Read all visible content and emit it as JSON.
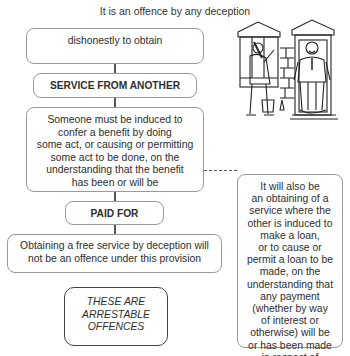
{
  "title": "It is an offence by any deception",
  "flow": {
    "box1": "dishonestly to obtain",
    "box2": "SERVICE FROM ANOTHER",
    "box3": "Someone must be induced to\nconfer a benefit by doing\nsome act, or causing or permitting\nsome act to be done, on the\nunderstanding that the benefit\nhas been or will be",
    "box4": "PAID FOR",
    "box5": "Obtaining a free service by deception will\nnot be an offence under this provision",
    "box6": "THESE ARE\nARRESTABLE\nOFFENCES"
  },
  "side_note": "It will also be\nan obtaining of a\nservice where the\nother is induced to\nmake a loan,\nor to cause or\npermit a loan to be\nmade, on the\nunderstanding that\nany payment\n(whether by way\nof interest or\notherwise) will be\nor has been made\nin respect of\nthe loan",
  "illustration": "window-cleaner-at-doorway-cartoon"
}
